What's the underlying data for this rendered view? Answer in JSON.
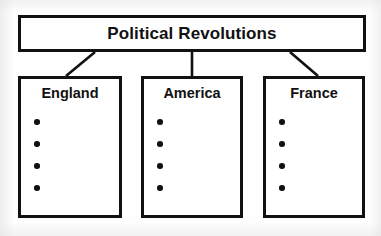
{
  "diagram": {
    "type": "hierarchy-tree",
    "orientation": "top-down",
    "background_color": "#ffffff",
    "stroke_color": "#111111",
    "root": {
      "label": "Political Revolutions",
      "box": {
        "x": 18,
        "y": 15,
        "width": 348,
        "height": 37
      }
    },
    "children": [
      {
        "id": "england",
        "label": "England",
        "box": {
          "x": 18,
          "y": 76,
          "width": 104,
          "height": 142
        },
        "bullets": [
          "",
          "",
          "",
          ""
        ],
        "bullet_count": 4,
        "connector": {
          "kind": "diagonal",
          "from_x": 95,
          "from_y": 52,
          "to_x": 66,
          "to_y": 76
        }
      },
      {
        "id": "america",
        "label": "America",
        "box": {
          "x": 141,
          "y": 76,
          "width": 102,
          "height": 142
        },
        "bullets": [
          "",
          "",
          "",
          ""
        ],
        "bullet_count": 4,
        "connector": {
          "kind": "vertical",
          "from_x": 192,
          "from_y": 52,
          "to_x": 192,
          "to_y": 76
        }
      },
      {
        "id": "france",
        "label": "France",
        "box": {
          "x": 263,
          "y": 76,
          "width": 102,
          "height": 142
        },
        "bullets": [
          "",
          "",
          "",
          ""
        ],
        "bullet_count": 4,
        "connector": {
          "kind": "diagonal",
          "from_x": 290,
          "from_y": 52,
          "to_x": 318,
          "to_y": 76
        }
      }
    ]
  }
}
